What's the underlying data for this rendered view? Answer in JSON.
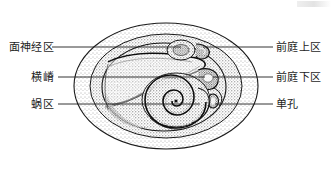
{
  "figure": {
    "width": 334,
    "height": 170,
    "background_color": "#ffffff",
    "ink_color": "#1d1d1d"
  },
  "labels": {
    "left": [
      {
        "id": "facial-nerve-area",
        "text": "面神经区",
        "leader_y": 47,
        "leader_x1": 52,
        "leader_x2": 181
      },
      {
        "id": "transverse-crest",
        "text": "横嵴",
        "leader_y": 77,
        "leader_x1": 58,
        "leader_x2": 205
      },
      {
        "id": "cochlear-area",
        "text": "蜗区",
        "leader_y": 104,
        "leader_x1": 58,
        "leader_x2": 200
      }
    ],
    "right": [
      {
        "id": "superior-vestibular-area",
        "text": "前庭上区",
        "leader_y": 47,
        "leader_x1": 203,
        "leader_x2": 273
      },
      {
        "id": "inferior-vestibular-area",
        "text": "前庭下区",
        "leader_y": 77,
        "leader_x1": 213,
        "leader_x2": 273
      },
      {
        "id": "singular-foramen",
        "text": "单孔",
        "leader_y": 104,
        "leader_x1": 215,
        "leader_x2": 273
      }
    ]
  },
  "drawing": {
    "outer_oval": {
      "cx": 166,
      "cy": 86,
      "rx": 92,
      "ry": 63
    },
    "middle_oval": {
      "cx": 166,
      "cy": 86,
      "rx": 76,
      "ry": 52
    },
    "inner_oval": {
      "cx": 164,
      "cy": 87,
      "rx": 62,
      "ry": 44
    },
    "cochlear_spiral": {
      "cx": 177,
      "cy": 100,
      "turns": 2.6
    },
    "stipple_density": "high",
    "style": "stippled ink anatomical drawing"
  }
}
